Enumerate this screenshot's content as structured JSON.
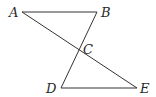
{
  "diagram": {
    "type": "geometry",
    "points": {
      "A": {
        "label": "A",
        "x": 22,
        "y": 12
      },
      "B": {
        "label": "B",
        "x": 97,
        "y": 12
      },
      "C": {
        "label": "C",
        "x": 79,
        "y": 51
      },
      "D": {
        "label": "D",
        "x": 61,
        "y": 88
      },
      "E": {
        "label": "E",
        "x": 137,
        "y": 88
      }
    },
    "segments": [
      {
        "from": "A",
        "to": "B"
      },
      {
        "from": "A",
        "to": "E"
      },
      {
        "from": "B",
        "to": "D"
      },
      {
        "from": "D",
        "to": "E"
      }
    ],
    "labels": {
      "A": "A",
      "B": "B",
      "C": "C",
      "D": "D",
      "E": "E"
    },
    "colors": {
      "line": "#333333",
      "text": "#2a2a2a",
      "background": "#ffffff"
    }
  }
}
